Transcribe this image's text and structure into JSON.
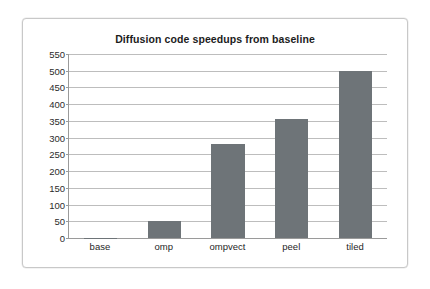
{
  "chart_data": {
    "type": "bar",
    "title": "Diffusion code speedups from baseline",
    "xlabel": "",
    "ylabel": "",
    "categories": [
      "base",
      "omp",
      "ompvect",
      "peel",
      "tiled"
    ],
    "values": [
      1,
      50,
      280,
      357,
      498
    ],
    "ylim": [
      0,
      550
    ],
    "ytick_step": 50,
    "yticks": [
      0,
      50,
      100,
      150,
      200,
      250,
      300,
      350,
      400,
      450,
      500,
      550
    ],
    "ytick_labels": [
      "0",
      "50",
      "100",
      "150",
      "200",
      "250",
      "300",
      "350",
      "400",
      "450",
      "500",
      "550"
    ],
    "grid": true,
    "legend": false,
    "legend_position": "none",
    "series": [
      {
        "name": "speedup",
        "values": [
          1,
          50,
          280,
          357,
          498
        ]
      }
    ],
    "colors": {
      "bar_fill": "#6e7478",
      "gridline": "#bdbdbd",
      "axis": "#9a9a9a",
      "plot_background": "#ffffff",
      "frame_border": "#c8c8c8",
      "title_text": "#1c1c1c",
      "tick_text": "#2b2b2b"
    }
  }
}
